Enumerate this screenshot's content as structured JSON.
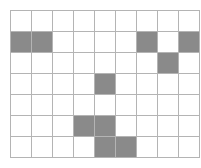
{
  "figure": {
    "kind": "grid-lattice-shading",
    "columns": 9,
    "rows": 7,
    "cell_width_px": 20,
    "cell_height_px": 20,
    "colors": {
      "filled": "#8a8a8a",
      "empty": "#ffffff",
      "gridline": "#b4b4b4",
      "border": "#9b9b9b",
      "background": "#ffffff"
    },
    "filled_cells": [
      {
        "row": 2,
        "col": 1
      },
      {
        "row": 2,
        "col": 2
      },
      {
        "row": 2,
        "col": 7
      },
      {
        "row": 2,
        "col": 9
      },
      {
        "row": 3,
        "col": 8
      },
      {
        "row": 4,
        "col": 5
      },
      {
        "row": 6,
        "col": 4
      },
      {
        "row": 6,
        "col": 5
      },
      {
        "row": 7,
        "col": 5
      },
      {
        "row": 7,
        "col": 6
      }
    ],
    "cell_matrix": [
      [
        0,
        0,
        0,
        0,
        0,
        0,
        0,
        0,
        0
      ],
      [
        1,
        1,
        0,
        0,
        0,
        0,
        1,
        0,
        1
      ],
      [
        0,
        0,
        0,
        0,
        0,
        0,
        0,
        1,
        0
      ],
      [
        0,
        0,
        0,
        0,
        1,
        0,
        0,
        0,
        0
      ],
      [
        0,
        0,
        0,
        0,
        0,
        0,
        0,
        0,
        0
      ],
      [
        0,
        0,
        0,
        1,
        1,
        0,
        0,
        0,
        0
      ],
      [
        0,
        0,
        0,
        0,
        1,
        1,
        0,
        0,
        0
      ]
    ],
    "filled_count": 10,
    "total_cells": 63
  }
}
